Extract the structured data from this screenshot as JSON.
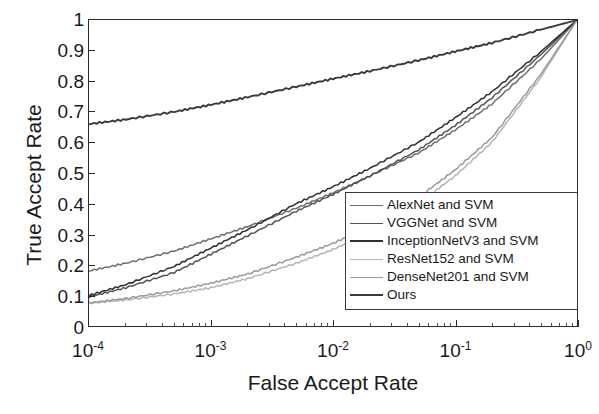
{
  "chart_data": {
    "type": "line",
    "title": "",
    "xlabel": "False Accept Rate",
    "ylabel": "True Accept Rate",
    "xscale": "log",
    "yscale": "linear",
    "xlim": [
      0.0001,
      1
    ],
    "ylim": [
      0,
      1
    ],
    "grid": false,
    "legend_position": "lower right inside",
    "x_tick_labels": [
      "10-4",
      "10-3",
      "10-2",
      "10-1",
      "100"
    ],
    "x_tick_mantissa": [
      "10",
      "10",
      "10",
      "10",
      "10"
    ],
    "x_tick_exponents": [
      "-4",
      "-3",
      "-2",
      "-1",
      "0"
    ],
    "y_tick_labels": [
      "0",
      "0.1",
      "0.2",
      "0.3",
      "0.4",
      "0.5",
      "0.6",
      "0.7",
      "0.8",
      "0.9",
      "1"
    ],
    "y_tick_values": [
      0,
      0.1,
      0.2,
      0.3,
      0.4,
      0.5,
      0.6,
      0.7,
      0.8,
      0.9,
      1
    ],
    "x": [
      0.0001,
      0.0002,
      0.0005,
      0.001,
      0.002,
      0.005,
      0.01,
      0.02,
      0.05,
      0.1,
      0.2,
      0.5,
      1.0
    ],
    "series": [
      {
        "name": "AlexNet and SVM",
        "color": "#6e6e6e",
        "values": [
          0.18,
          0.205,
          0.245,
          0.285,
          0.325,
          0.385,
          0.435,
          0.49,
          0.565,
          0.64,
          0.725,
          0.87,
          1.0
        ]
      },
      {
        "name": "VGGNet and SVM",
        "color": "#555555",
        "values": [
          0.095,
          0.125,
          0.175,
          0.235,
          0.295,
          0.375,
          0.43,
          0.49,
          0.575,
          0.655,
          0.745,
          0.885,
          1.0
        ]
      },
      {
        "name": "InceptionNetV3 and SVM",
        "color": "#2f2f2f",
        "values": [
          0.1,
          0.135,
          0.195,
          0.255,
          0.315,
          0.4,
          0.455,
          0.515,
          0.6,
          0.68,
          0.765,
          0.895,
          1.0
        ]
      },
      {
        "name": "ResNet152 and SVM",
        "color": "#b5b5b5",
        "values": [
          0.075,
          0.085,
          0.105,
          0.125,
          0.155,
          0.205,
          0.25,
          0.305,
          0.4,
          0.49,
          0.6,
          0.81,
          1.0
        ]
      },
      {
        "name": "DenseNet201 and SVM",
        "color": "#9a9a9a",
        "values": [
          0.075,
          0.09,
          0.115,
          0.14,
          0.17,
          0.225,
          0.27,
          0.325,
          0.42,
          0.51,
          0.615,
          0.82,
          1.0
        ]
      },
      {
        "name": "Ours",
        "color": "#3a3a3a",
        "values": [
          0.66,
          0.675,
          0.7,
          0.723,
          0.748,
          0.782,
          0.808,
          0.833,
          0.868,
          0.897,
          0.925,
          0.968,
          1.0
        ]
      }
    ]
  },
  "legend": {
    "entries": [
      {
        "label": "AlexNet and SVM",
        "color": "#6e6e6e",
        "width": 1.6
      },
      {
        "label": "VGGNet and SVM",
        "color": "#555555",
        "width": 1.9
      },
      {
        "label": "InceptionNetV3 and SVM",
        "color": "#2f2f2f",
        "width": 2.0
      },
      {
        "label": "ResNet152 and SVM",
        "color": "#b5b5b5",
        "width": 1.5
      },
      {
        "label": "DenseNet201 and SVM",
        "color": "#9a9a9a",
        "width": 1.6
      },
      {
        "label": "Ours",
        "color": "#3a3a3a",
        "width": 2.0
      }
    ]
  },
  "colors": {
    "axis": "#2b2b2b",
    "text": "#1a1a1a",
    "background": "#ffffff"
  }
}
